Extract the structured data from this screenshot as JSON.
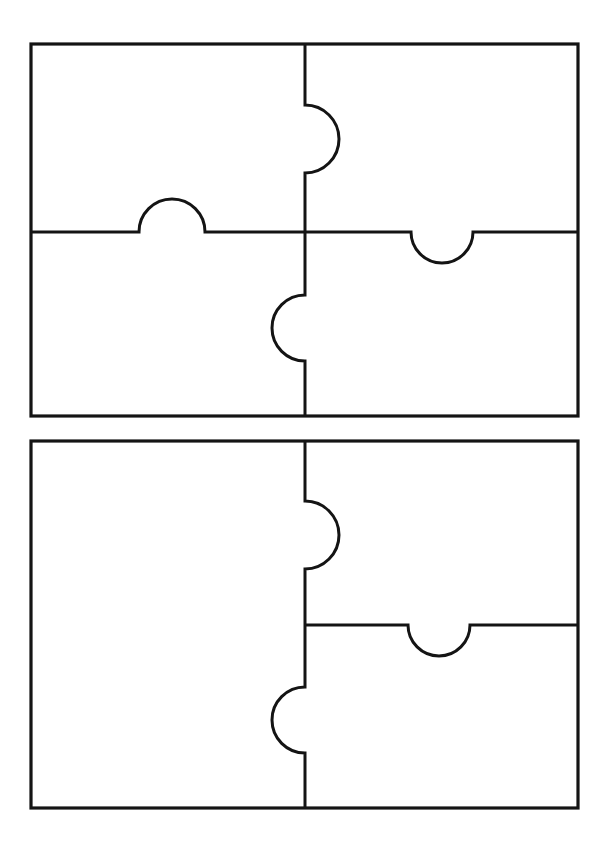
{
  "document": {
    "title": "Blank Jigsaw Puzzle Template Worksheet",
    "background_color": "#ffffff",
    "line_color": "#141414",
    "page_width": 605,
    "page_height": 859,
    "figure_count": 2,
    "figure_type": "jigsaw-puzzle-outline"
  },
  "figures": [
    {
      "id": "puzzle-top",
      "label": "Four-piece jigsaw puzzle outline (top)",
      "piece_count": 4,
      "frame": {
        "x": 31,
        "y": 44,
        "width": 547,
        "height": 372
      },
      "divider_vertical_x": 305,
      "divider_horizontal_y": 232,
      "knobs": [
        {
          "name": "upper-vertical-tab",
          "direction": "right",
          "center_y": 139,
          "radius": 34
        },
        {
          "name": "lower-vertical-tab",
          "direction": "left",
          "center_y": 328,
          "radius": 33
        },
        {
          "name": "left-horizontal-tab",
          "direction": "up",
          "center_x": 172,
          "radius": 33
        },
        {
          "name": "right-horizontal-tab",
          "direction": "down",
          "center_x": 442,
          "radius": 31
        }
      ],
      "pieces": [
        {
          "name": "top-left-piece"
        },
        {
          "name": "top-right-piece"
        },
        {
          "name": "bottom-left-piece"
        },
        {
          "name": "bottom-right-piece"
        }
      ]
    },
    {
      "id": "puzzle-bottom",
      "label": "Three-piece jigsaw puzzle outline (bottom)",
      "piece_count": 3,
      "frame": {
        "x": 31,
        "y": 441,
        "width": 547,
        "height": 367
      },
      "divider_vertical_x": 305,
      "divider_horizontal_y": 625,
      "knobs": [
        {
          "name": "upper-vertical-tab",
          "direction": "right",
          "center_y": 535,
          "radius": 34
        },
        {
          "name": "lower-vertical-tab",
          "direction": "left",
          "center_y": 720,
          "radius": 33
        },
        {
          "name": "right-horizontal-tab",
          "direction": "down",
          "center_x": 439,
          "radius": 31
        }
      ],
      "pieces": [
        {
          "name": "left-piece"
        },
        {
          "name": "top-right-piece"
        },
        {
          "name": "bottom-right-piece"
        }
      ]
    }
  ]
}
